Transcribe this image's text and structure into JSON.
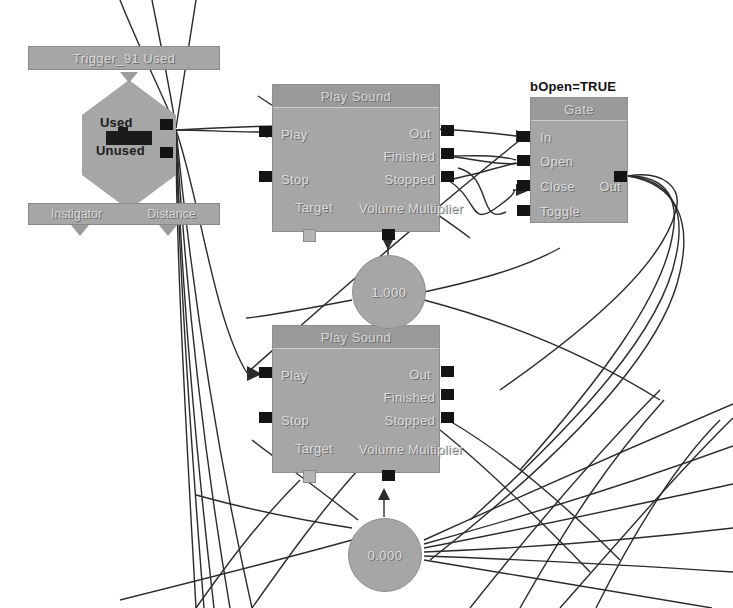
{
  "canvas": {
    "width": 733,
    "height": 608,
    "background": "#ffffff",
    "wire_color": "#2b2b2b"
  },
  "graph": {
    "event": {
      "title": "Trigger_91 Used",
      "outputs": [
        {
          "label": "Used"
        },
        {
          "label": "Unused"
        }
      ],
      "variables": [
        {
          "label": "Instigator"
        },
        {
          "label": "Distance"
        }
      ]
    },
    "nodes": [
      {
        "id": "play-sound-1",
        "title": "Play Sound",
        "inputs": [
          {
            "label": "Play"
          },
          {
            "label": "Stop"
          }
        ],
        "outputs": [
          {
            "label": "Out"
          },
          {
            "label": "Finished"
          },
          {
            "label": "Stopped"
          }
        ],
        "var_pins": [
          {
            "label": "Target"
          },
          {
            "label": "Volume Multiplier"
          }
        ]
      },
      {
        "id": "play-sound-2",
        "title": "Play Sound",
        "inputs": [
          {
            "label": "Play"
          },
          {
            "label": "Stop"
          }
        ],
        "outputs": [
          {
            "label": "Out"
          },
          {
            "label": "Finished"
          },
          {
            "label": "Stopped"
          }
        ],
        "var_pins": [
          {
            "label": "Target"
          },
          {
            "label": "Volume Multiplier"
          }
        ]
      },
      {
        "id": "gate",
        "title": "Gate",
        "comment": "bOpen=TRUE",
        "inputs": [
          {
            "label": "In"
          },
          {
            "label": "Open"
          },
          {
            "label": "Close"
          },
          {
            "label": "Toggle"
          }
        ],
        "outputs": [
          {
            "label": "Out"
          }
        ]
      }
    ],
    "variables": [
      {
        "id": "float-1",
        "value": "1.000"
      },
      {
        "id": "float-2",
        "value": "0.000"
      }
    ]
  }
}
